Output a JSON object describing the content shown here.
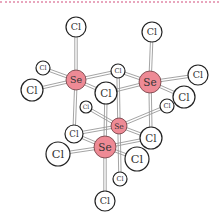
{
  "figure": {
    "colors": {
      "se_fill": "#ee8a95",
      "se_stroke": "#6b3a3f",
      "cl_fill": "#ffffff",
      "cl_stroke": "#222222",
      "bond": "#9a9a9a",
      "top_rule": "#e8a6bd"
    },
    "atoms": [
      {
        "id": "cl_top_left",
        "el": "Cl",
        "label": "Cl",
        "x": 76,
        "y": 27,
        "r": 10
      },
      {
        "id": "cl_top_right",
        "el": "Cl",
        "label": "Cl",
        "x": 152,
        "y": 32,
        "r": 10
      },
      {
        "id": "cl_small_left",
        "el": "Cl",
        "label": "Cl",
        "x": 43,
        "y": 68,
        "r": 7
      },
      {
        "id": "cl_left",
        "el": "Cl",
        "label": "Cl",
        "x": 32,
        "y": 90,
        "r": 11
      },
      {
        "id": "cl_bridge_top",
        "el": "Cl",
        "label": "Cl",
        "x": 118,
        "y": 71,
        "r": 7
      },
      {
        "id": "cl_right",
        "el": "Cl",
        "label": "Cl",
        "x": 198,
        "y": 75,
        "r": 10
      },
      {
        "id": "cl_hidden",
        "el": "Cl",
        "label": "Cl",
        "x": 86,
        "y": 107,
        "r": 6
      },
      {
        "id": "cl_right_small",
        "el": "Cl",
        "label": "Cl",
        "x": 167,
        "y": 106,
        "r": 7
      },
      {
        "id": "cl_mid_left",
        "el": "Cl",
        "label": "Cl",
        "x": 74,
        "y": 134,
        "r": 9
      },
      {
        "id": "cl_bottom_left",
        "el": "Cl",
        "label": "Cl",
        "x": 58,
        "y": 154,
        "r": 12
      },
      {
        "id": "cl_bottom_small",
        "el": "Cl",
        "label": "Cl",
        "x": 120,
        "y": 179,
        "r": 7
      },
      {
        "id": "cl_bottom",
        "el": "Cl",
        "label": "Cl",
        "x": 105,
        "y": 201,
        "r": 10
      },
      {
        "id": "se_mid",
        "el": "Se",
        "label": "Se",
        "x": 119,
        "y": 126,
        "r": 8
      },
      {
        "id": "cl_mid_right",
        "el": "Cl",
        "label": "Cl",
        "x": 151,
        "y": 138,
        "r": 11
      },
      {
        "id": "se_top_left",
        "el": "Se",
        "label": "Se",
        "x": 76,
        "y": 80,
        "r": 10
      },
      {
        "id": "cl_center",
        "el": "Cl",
        "label": "Cl",
        "x": 106,
        "y": 93,
        "r": 11
      },
      {
        "id": "se_top_right",
        "el": "Se",
        "label": "Se",
        "x": 150,
        "y": 82,
        "r": 11
      },
      {
        "id": "cl_right2",
        "el": "Cl",
        "label": "Cl",
        "x": 184,
        "y": 97,
        "r": 11
      },
      {
        "id": "se_front",
        "el": "Se",
        "label": "Se",
        "x": 105,
        "y": 147,
        "r": 11
      },
      {
        "id": "cl_front_right",
        "el": "Cl",
        "label": "Cl",
        "x": 137,
        "y": 159,
        "r": 12
      }
    ],
    "bonds": [
      [
        "se_top_left",
        "cl_top_left"
      ],
      [
        "se_top_left",
        "cl_small_left"
      ],
      [
        "se_top_left",
        "cl_left"
      ],
      [
        "se_top_left",
        "cl_bridge_top"
      ],
      [
        "se_top_left",
        "cl_center"
      ],
      [
        "se_top_left",
        "cl_mid_left"
      ],
      [
        "se_top_right",
        "cl_top_right"
      ],
      [
        "se_top_right",
        "cl_right"
      ],
      [
        "se_top_right",
        "cl_right2"
      ],
      [
        "se_top_right",
        "cl_bridge_top"
      ],
      [
        "se_top_right",
        "cl_mid_right"
      ],
      [
        "se_top_right",
        "cl_center"
      ],
      [
        "se_mid",
        "cl_hidden"
      ],
      [
        "se_mid",
        "cl_right_small"
      ],
      [
        "se_mid",
        "cl_bridge_top"
      ],
      [
        "se_mid",
        "cl_mid_left"
      ],
      [
        "se_mid",
        "cl_mid_right"
      ],
      [
        "se_mid",
        "cl_bottom_small"
      ],
      [
        "se_front",
        "cl_bottom_left"
      ],
      [
        "se_front",
        "cl_front_right"
      ],
      [
        "se_front",
        "cl_bottom"
      ],
      [
        "se_front",
        "cl_center"
      ],
      [
        "se_front",
        "cl_mid_left"
      ],
      [
        "se_front",
        "cl_mid_right"
      ]
    ]
  }
}
